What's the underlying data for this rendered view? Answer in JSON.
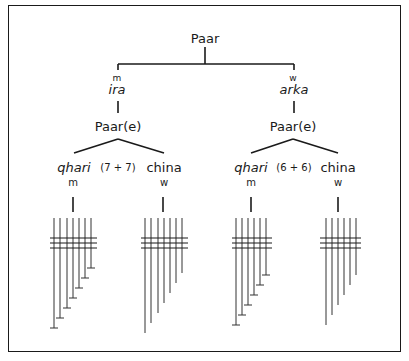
{
  "diagram": {
    "root": {
      "label": "Paar"
    },
    "halves": [
      {
        "name": "ira",
        "gender": "m",
        "node_label": "Paar(e)",
        "tube_count_note": "(7 + 7)",
        "instruments": [
          {
            "name": "qhari",
            "gender": "m",
            "tubes": 7
          },
          {
            "name": "china",
            "gender": "w",
            "tubes": 7
          }
        ]
      },
      {
        "name": "arka",
        "gender": "w",
        "node_label": "Paar(e)",
        "tube_count_note": "(6 + 6)",
        "instruments": [
          {
            "name": "qhari",
            "gender": "m",
            "tubes": 6
          },
          {
            "name": "china",
            "gender": "w",
            "tubes": 6
          }
        ]
      }
    ]
  }
}
